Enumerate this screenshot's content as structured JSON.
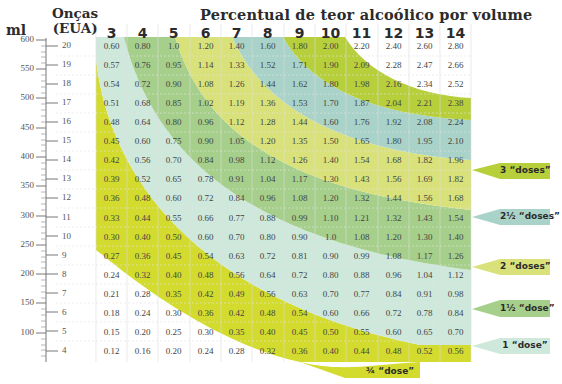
{
  "header": {
    "title": "Percentual de teor alcoólico por volume",
    "ml_label": "ml",
    "oz_label_line1": "Onças",
    "oz_label_line2": "(EUA)"
  },
  "columns": [
    "3",
    "4",
    "5",
    "6",
    "7",
    "8",
    "9",
    "10",
    "11",
    "12",
    "13",
    "14"
  ],
  "ml_ticks": [
    "600",
    "550",
    "500",
    "450",
    "400",
    "350",
    "300",
    "250",
    "200",
    "150",
    "100"
  ],
  "rows": [
    {
      "oz": "20",
      "values": [
        "0.60",
        "0.80",
        "1.0",
        "1.20",
        "1.40",
        "1.60",
        "1.80",
        "2.00",
        "2.20",
        "2.40",
        "2.60",
        "2.80"
      ]
    },
    {
      "oz": "19",
      "values": [
        "0.57",
        "0.76",
        "0.95",
        "1.14",
        "1.33",
        "1.52",
        "1.71",
        "1.90",
        "2.09",
        "2.28",
        "2.47",
        "2.66"
      ]
    },
    {
      "oz": "18",
      "values": [
        "0.54",
        "0.72",
        "0.90",
        "1.08",
        "1.26",
        "1.44",
        "1.62",
        "1.80",
        "1.98",
        "2.16",
        "2.34",
        "2.52"
      ]
    },
    {
      "oz": "17",
      "values": [
        "0.51",
        "0.68",
        "0.85",
        "1.02",
        "1.19",
        "1.36",
        "1.53",
        "1.70",
        "1.87",
        "2.04",
        "2.21",
        "2.38"
      ]
    },
    {
      "oz": "16",
      "values": [
        "0.48",
        "0.64",
        "0.80",
        "0.96",
        "1.12",
        "1.28",
        "1.44",
        "1.60",
        "1.76",
        "1.92",
        "2.08",
        "2.24"
      ]
    },
    {
      "oz": "15",
      "values": [
        "0.45",
        "0.60",
        "0.75",
        "0.90",
        "1.05",
        "1.20",
        "1.35",
        "1.50",
        "1.65",
        "1.80",
        "1.95",
        "2.10"
      ]
    },
    {
      "oz": "14",
      "values": [
        "0.42",
        "0.56",
        "0.70",
        "0.84",
        "0.98",
        "1.12",
        "1.26",
        "1.40",
        "1.54",
        "1.68",
        "1.82",
        "1.96"
      ]
    },
    {
      "oz": "13",
      "values": [
        "0.39",
        "0.52",
        "0.65",
        "0.78",
        "0.91",
        "1.04",
        "1.17",
        "1.30",
        "1.43",
        "1.56",
        "1.69",
        "1.82"
      ]
    },
    {
      "oz": "12",
      "values": [
        "0.36",
        "0.48",
        "0.60",
        "0.72",
        "0.84",
        "0.96",
        "1.08",
        "1.20",
        "1.32",
        "1.44",
        "1.56",
        "1.68"
      ]
    },
    {
      "oz": "11",
      "values": [
        "0.33",
        "0.44",
        "0.55",
        "0.66",
        "0.77",
        "0.88",
        "0.99",
        "1.10",
        "1.21",
        "1.32",
        "1.43",
        "1.54"
      ]
    },
    {
      "oz": "10",
      "values": [
        "0.30",
        "0.40",
        "0.50",
        "0.60",
        "0.70",
        "0.80",
        "0.90",
        "1.0",
        "1.08",
        "1.20",
        "1.30",
        "1.40"
      ]
    },
    {
      "oz": "9",
      "values": [
        "0.27",
        "0.36",
        "0.45",
        "0.54",
        "0.63",
        "0.72",
        "0.81",
        "0.90",
        "0.99",
        "1.08",
        "1.17",
        "1.26"
      ]
    },
    {
      "oz": "8",
      "values": [
        "0.24",
        "0.32",
        "0.40",
        "0.48",
        "0.56",
        "0.64",
        "0.72",
        "0.80",
        "0.88",
        "0.96",
        "1.04",
        "1.12"
      ]
    },
    {
      "oz": "7",
      "values": [
        "0.21",
        "0.28",
        "0.35",
        "0.42",
        "0.49",
        "0.56",
        "0.63",
        "0.70",
        "0.77",
        "0.84",
        "0.91",
        "0.98"
      ]
    },
    {
      "oz": "6",
      "values": [
        "0.18",
        "0.24",
        "0.30",
        "0.36",
        "0.42",
        "0.48",
        "0.54",
        "0.60",
        "0.66",
        "0.72",
        "0.78",
        "0.84"
      ]
    },
    {
      "oz": "5",
      "values": [
        "0.15",
        "0.20",
        "0.25",
        "0.30",
        "0.35",
        "0.40",
        "0.45",
        "0.50",
        "0.55",
        "0.60",
        "0.65",
        "0.70"
      ]
    },
    {
      "oz": "4",
      "values": [
        "0.12",
        "0.16",
        "0.20",
        "0.24",
        "0.28",
        "0.32",
        "0.36",
        "0.40",
        "0.44",
        "0.48",
        "0.52",
        "0.56"
      ]
    }
  ],
  "doses": [
    {
      "label": "3 “doses”",
      "color": "#b8cf3c"
    },
    {
      "label": "2½ “doses”",
      "color": "#a9d3c8"
    },
    {
      "label": "2 “doses”",
      "color": "#d9e27a"
    },
    {
      "label": "1½ “dose”",
      "color": "#a6cf8c"
    },
    {
      "label": "1 “dose”",
      "color": "#cfe8dc"
    },
    {
      "label": "¾ “dose”",
      "color": "#d3dc2e"
    }
  ],
  "chart_data": {
    "type": "table",
    "title": "Percentual de teor alcoólico por volume",
    "xlabel": "Percentual de teor alcoólico por volume",
    "ylabel": "Onças (EUA) / ml",
    "columns": [
      3,
      4,
      5,
      6,
      7,
      8,
      9,
      10,
      11,
      12,
      13,
      14
    ],
    "rows_oz": [
      20,
      19,
      18,
      17,
      16,
      15,
      14,
      13,
      12,
      11,
      10,
      9,
      8,
      7,
      6,
      5,
      4
    ],
    "ml_axis": {
      "ticks": [
        600,
        550,
        500,
        450,
        400,
        350,
        300,
        250,
        200,
        150,
        100
      ]
    },
    "formula": "doses = oz × ABV% / 10 (approx. 0.6 oz pure alcohol per dose)",
    "bands": [
      "¾ “dose”",
      "1 “dose”",
      "1½ “dose”",
      "2 “doses”",
      "2½ “doses”",
      "3 “doses”"
    ],
    "values_ref": "rows[].values"
  }
}
